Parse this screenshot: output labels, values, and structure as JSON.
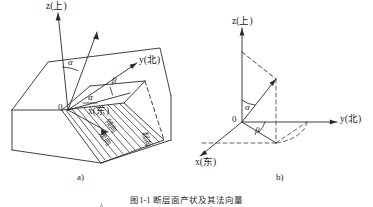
{
  "figure": {
    "caption": "图1-1 断层面产状及其法向量",
    "panels": [
      {
        "tag": "a)",
        "name": "block-diagram",
        "labels": {
          "z_axis": "z(上)",
          "y_axis": "y(北)",
          "x_axis": "x(东)",
          "normal_vector": "n",
          "normal_hat": "^",
          "origin": "0",
          "angle_alpha_top": "α",
          "angle_beta": "β",
          "angle_alpha_low": "α",
          "dip_direction": "倾向",
          "strike": "走向",
          "side_label": "起向"
        }
      },
      {
        "tag": "b)",
        "name": "vector-diagram",
        "labels": {
          "z_axis": "z(上)",
          "y_axis": "y(北)",
          "x_axis": "x(东)",
          "normal_vector": "n",
          "normal_hat": "^",
          "origin": "0",
          "angle_alpha": "α",
          "angle_beta": "β"
        }
      }
    ]
  },
  "style": {
    "line_color": "#2b2b2b",
    "dashed_color": "#4a4a4a",
    "hatch_color": "#333333",
    "background": "#ffffff"
  }
}
